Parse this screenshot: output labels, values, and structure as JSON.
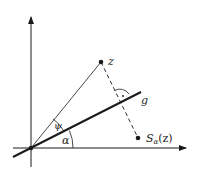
{
  "diagram": {
    "colors": {
      "background": "#ffffff",
      "stroke": "#1a1a1a"
    },
    "labels": {
      "point_z": "z",
      "line_g": "g",
      "angle_psi": "ψ",
      "angle_alpha": "α",
      "reflected_point_main": "S",
      "reflected_point_sub": "α",
      "reflected_point_arg": "(z)"
    },
    "elements": [
      {
        "type": "axis",
        "name": "x-axis",
        "direction": "horizontal",
        "arrow": true
      },
      {
        "type": "axis",
        "name": "y-axis",
        "direction": "vertical",
        "arrow": true
      },
      {
        "type": "line",
        "name": "g",
        "style": "thick",
        "through": "origin",
        "angle": "α"
      },
      {
        "type": "segment",
        "name": "origin-to-z",
        "style": "thin"
      },
      {
        "type": "segment",
        "name": "z-to-Sα(z)",
        "style": "dashed",
        "perpendicular_to": "g"
      },
      {
        "type": "point",
        "name": "z"
      },
      {
        "type": "point",
        "name": "Sα(z)"
      },
      {
        "type": "point",
        "name": "origin"
      },
      {
        "type": "angle-arc",
        "name": "α",
        "between": [
          "x-axis",
          "g"
        ]
      },
      {
        "type": "angle-arc",
        "name": "ψ",
        "between": [
          "g",
          "origin-to-z"
        ]
      },
      {
        "type": "right-angle-mark",
        "at": "intersection of dashed segment and g"
      }
    ]
  }
}
